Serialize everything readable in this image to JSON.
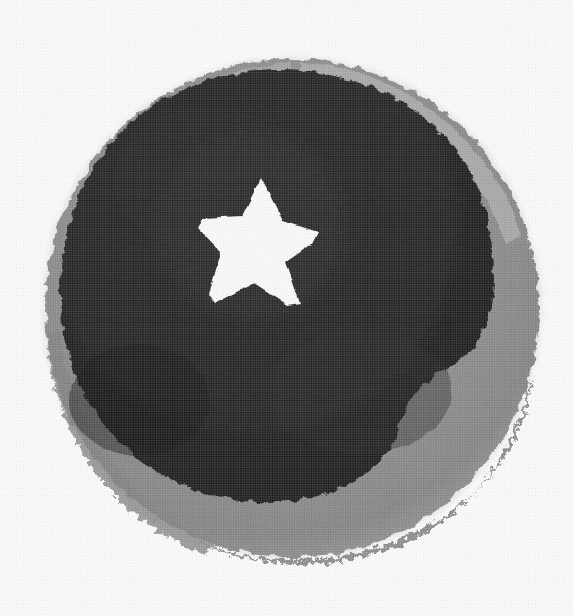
{
  "image": {
    "kind": "scanned-halftone-artwork",
    "subject": "circular badge with five-pointed star cutout",
    "width": 573,
    "height": 616,
    "background_color": "#ffffff",
    "caption": ""
  },
  "palette": {
    "background": "#ffffff",
    "outer_ring_gray": "#8d8d8d",
    "outer_ring_gray_light": "#a7a7a7",
    "outer_ring_gray_dark": "#6f6f6f",
    "outer_fringe_gray": "#c2c2c2",
    "inner_disk_black": "#181818",
    "inner_disk_black_soft": "#242424",
    "star_white": "#fdfdfd"
  },
  "shapes": {
    "outer_disk": {
      "name": "outer-ring-disk",
      "fill": "#8d8d8d",
      "center_x": 292,
      "center_y": 308,
      "radius": 248,
      "edge": "rough-fibrous",
      "bounds": {
        "left": 45,
        "top": 58,
        "right": 540,
        "bottom": 558
      }
    },
    "inner_disk": {
      "name": "inner-dark-disk",
      "fill": "#181818",
      "center_x": 278,
      "center_y": 288,
      "radius": 218,
      "edge": "irregular",
      "bounds": {
        "left": 62,
        "top": 70,
        "right": 492,
        "bottom": 505
      }
    },
    "star": {
      "name": "five-pointed-star",
      "fill": "#fdfdfd",
      "points": 5,
      "center_x": 258,
      "center_y": 246,
      "outer_radius": 66,
      "inner_radius": 27,
      "rotation_deg": -4,
      "bounds": {
        "left": 198,
        "top": 178,
        "right": 318,
        "bottom": 305
      }
    }
  },
  "ring_thickness": {
    "top_px": 14,
    "right_px": 46,
    "bottom_px": 58,
    "left_px": 40
  },
  "texture": {
    "type": "halftone-dot-screen",
    "dot_pitch_px": 1.7,
    "visible_grain": true
  }
}
